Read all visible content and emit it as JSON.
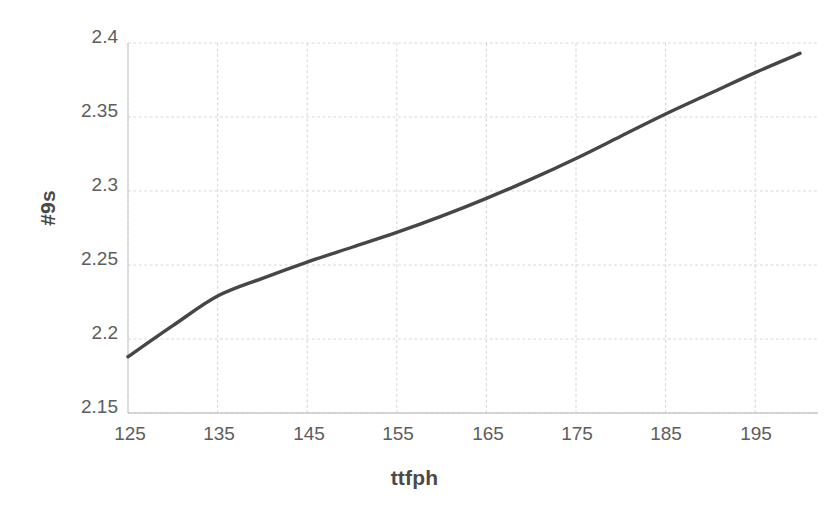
{
  "chart_data": {
    "type": "line",
    "title": "",
    "xlabel": "ttfph",
    "ylabel": "#9s",
    "xlim": [
      125,
      200
    ],
    "ylim": [
      2.15,
      2.4
    ],
    "grid": true,
    "legend": "none",
    "line_color": "#464646",
    "grid_color": "#d9d9d9",
    "tick_color": "#5d5d5d",
    "xticks": [
      125,
      135,
      145,
      155,
      165,
      175,
      185,
      195
    ],
    "yticks": [
      2.15,
      2.2,
      2.25,
      2.3,
      2.35,
      2.4
    ],
    "xtick_labels": [
      "125",
      "135",
      "145",
      "155",
      "165",
      "175",
      "185",
      "195"
    ],
    "ytick_labels": [
      "2.15",
      "2.2",
      "2.25",
      "2.3",
      "2.35",
      "2.4"
    ],
    "series": [
      {
        "name": "#9s vs ttfph",
        "x": [
          125,
          130,
          135,
          140,
          145,
          150,
          155,
          160,
          165,
          170,
          175,
          180,
          185,
          190,
          195,
          200
        ],
        "y": [
          2.188,
          2.209,
          2.229,
          2.241,
          2.252,
          2.262,
          2.272,
          2.283,
          2.295,
          2.308,
          2.322,
          2.337,
          2.352,
          2.366,
          2.38,
          2.393
        ]
      }
    ]
  }
}
